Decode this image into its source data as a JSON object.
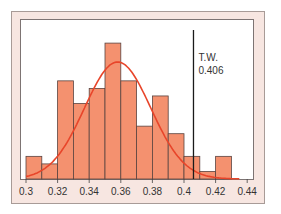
{
  "chart_data": {
    "type": "bar",
    "title": "",
    "xlabel": "",
    "ylabel": "",
    "bin_width": 0.01,
    "categories": [
      "0.30",
      "0.31",
      "0.32",
      "0.33",
      "0.34",
      "0.35",
      "0.36",
      "0.37",
      "0.38",
      "0.39",
      "0.40",
      "0.41",
      "0.42"
    ],
    "bin_starts": [
      0.3,
      0.31,
      0.32,
      0.33,
      0.34,
      0.35,
      0.36,
      0.37,
      0.38,
      0.39,
      0.4,
      0.41,
      0.42
    ],
    "values": [
      3,
      2,
      13,
      10,
      12,
      18,
      13,
      7,
      11,
      6,
      3,
      1,
      3
    ],
    "x_ticks": [
      "0.3",
      "0.32",
      "0.34",
      "0.36",
      "0.38",
      "0.4",
      "0.42",
      "0.44"
    ],
    "x_tick_values": [
      0.3,
      0.32,
      0.34,
      0.36,
      0.38,
      0.4,
      0.42,
      0.44
    ],
    "xlim": [
      0.3,
      0.44
    ],
    "ylim": [
      0,
      20
    ],
    "grid": false,
    "overlay": {
      "type": "normal-curve",
      "mean": 0.358,
      "peak": 15.5,
      "sd": 0.021
    },
    "annotation": {
      "label_line1": "T.W.",
      "label_line2": "0.406",
      "x": 0.406
    },
    "colors": {
      "bar_fill": "#f4916f",
      "bar_edge": "#5a4440",
      "curve": "#e8452a",
      "frame": "#f7e6e1",
      "marker_line": "#1a1a1a"
    }
  }
}
